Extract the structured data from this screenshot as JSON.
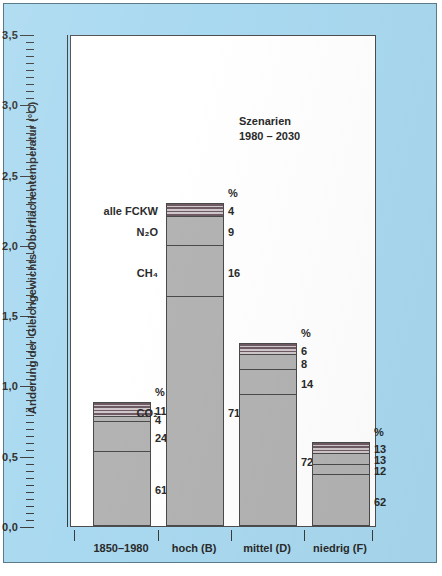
{
  "chart_data": {
    "type": "bar",
    "title": "",
    "subtitle": "",
    "annotation": {
      "line1": "Szenarien",
      "line2": "1980 – 2030"
    },
    "xlabel": "",
    "ylabel": "Änderung der Gleichgewichts-Oberflächentemperatur (°C)",
    "ylim": [
      0.0,
      3.5
    ],
    "ytick_labels": [
      "0,0",
      "0,5",
      "1,0",
      "1,5",
      "2,0",
      "2,5",
      "3,0",
      "3,5"
    ],
    "ytick_values": [
      0.0,
      0.5,
      1.0,
      1.5,
      2.0,
      2.5,
      3.0,
      3.5
    ],
    "minor_tick_step": 0.05,
    "grid": false,
    "legend_position": "inline-left-of-second-bar",
    "percent_header": "%",
    "series": [
      {
        "name": "CO2",
        "label": "CO₂",
        "fill": "solid"
      },
      {
        "name": "CH4",
        "label": "CH₄",
        "fill": "solid"
      },
      {
        "name": "N2O",
        "label": "N₂O",
        "fill": "solid"
      },
      {
        "name": "alle FCKW",
        "label": "alle FCKW",
        "fill": "hatch"
      }
    ],
    "categories": [
      "1850–1980",
      "hoch (B)",
      "mittel (D)",
      "niedrig (F)"
    ],
    "totals": [
      0.88,
      2.3,
      1.3,
      0.6
    ],
    "bars": [
      {
        "category": "1850–1980",
        "total": 0.88,
        "percent_header": "%",
        "segments": [
          {
            "series": "CO2",
            "percent": 61,
            "value": 0.537,
            "fill": "solid"
          },
          {
            "series": "CH4",
            "percent": 24,
            "value": 0.211,
            "fill": "solid"
          },
          {
            "series": "N2O",
            "percent": 4,
            "value": 0.035,
            "fill": "solid"
          },
          {
            "series": "alle FCKW",
            "percent": 11,
            "value": 0.097,
            "fill": "hatch"
          }
        ]
      },
      {
        "category": "hoch (B)",
        "total": 2.3,
        "percent_header": "%",
        "segments": [
          {
            "series": "CO2",
            "percent": 71,
            "value": 1.633,
            "fill": "solid"
          },
          {
            "series": "CH4",
            "percent": 16,
            "value": 0.368,
            "fill": "solid"
          },
          {
            "series": "N2O",
            "percent": 9,
            "value": 0.207,
            "fill": "solid"
          },
          {
            "series": "alle FCKW",
            "percent": 4,
            "value": 0.092,
            "fill": "hatch"
          }
        ]
      },
      {
        "category": "mittel (D)",
        "total": 1.3,
        "percent_header": "%",
        "segments": [
          {
            "series": "CO2",
            "percent": 72,
            "value": 0.936,
            "fill": "solid"
          },
          {
            "series": "CH4",
            "percent": 14,
            "value": 0.182,
            "fill": "solid"
          },
          {
            "series": "N2O",
            "percent": 8,
            "value": 0.104,
            "fill": "solid"
          },
          {
            "series": "alle FCKW",
            "percent": 6,
            "value": 0.078,
            "fill": "hatch"
          }
        ]
      },
      {
        "category": "niedrig (F)",
        "total": 0.6,
        "percent_header": "%",
        "segments": [
          {
            "series": "CO2",
            "percent": 62,
            "value": 0.372,
            "fill": "solid"
          },
          {
            "series": "CH4",
            "percent": 12,
            "value": 0.072,
            "fill": "solid"
          },
          {
            "series": "N2O",
            "percent": 13,
            "value": 0.078,
            "fill": "solid"
          },
          {
            "series": "alle FCKW",
            "percent": 13,
            "value": 0.078,
            "fill": "hatch"
          }
        ]
      }
    ]
  },
  "colors": {
    "background": "#a9d9f0",
    "plot_background": "#ffffff",
    "bar_solid": "#b3b3b3",
    "bar_hatch_dark": "#6e5a62",
    "bar_hatch_light": "#cfc7ca",
    "axis": "#3a3a3a",
    "text": "#2a2a2a"
  }
}
